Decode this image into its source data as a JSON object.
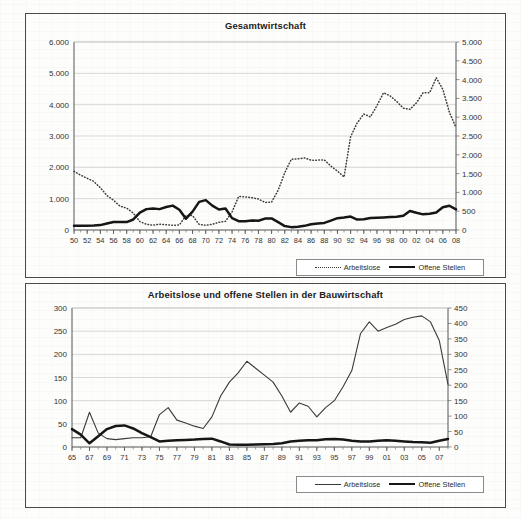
{
  "page": {
    "background_color": "#fdfdfc",
    "frame_color": "#4a4a4a"
  },
  "charts": [
    {
      "id": "top",
      "title": "Gesamtwirtschaft",
      "legend": [
        {
          "label": "Arbeitslose",
          "style": "dotted"
        },
        {
          "label": "Offene Stellen",
          "style": "thick"
        }
      ]
    },
    {
      "id": "bottom",
      "title": "Arbeitslose und offene Stellen in der Bauwirtschaft",
      "legend": [
        {
          "label": "Arbeitslose",
          "style": "thin"
        },
        {
          "label": "Offene Stellen",
          "style": "thick"
        }
      ]
    }
  ],
  "chart_data": [
    {
      "type": "line",
      "id": "gesamtwirtschaft",
      "title": "Gesamtwirtschaft",
      "xlabel": "",
      "ylabel": "",
      "grid": true,
      "legend_position": "bottom-right",
      "x": [
        1950,
        1951,
        1952,
        1953,
        1954,
        1955,
        1956,
        1957,
        1958,
        1959,
        1960,
        1961,
        1962,
        1963,
        1964,
        1965,
        1966,
        1967,
        1968,
        1969,
        1970,
        1971,
        1972,
        1973,
        1974,
        1975,
        1976,
        1977,
        1978,
        1979,
        1980,
        1981,
        1982,
        1983,
        1984,
        1985,
        1986,
        1987,
        1988,
        1989,
        1990,
        1991,
        1992,
        1993,
        1994,
        1995,
        1996,
        1997,
        1998,
        1999,
        2000,
        2001,
        2002,
        2003,
        2004,
        2005,
        2006,
        2007,
        2008
      ],
      "xtick_labels": [
        "50",
        "52",
        "54",
        "56",
        "58",
        "60",
        "62",
        "64",
        "66",
        "68",
        "70",
        "72",
        "74",
        "76",
        "78",
        "80",
        "82",
        "84",
        "86",
        "88",
        "90",
        "92",
        "94",
        "96",
        "98",
        "00",
        "02",
        "04",
        "06",
        "08"
      ],
      "xtick_step_years": 2,
      "axis_left": {
        "label": "Arbeitslose",
        "min": 0,
        "max": 6000,
        "step": 1000,
        "ticks": [
          "0",
          "1.000",
          "2.000",
          "3.000",
          "4.000",
          "5.000",
          "6.000"
        ]
      },
      "axis_right": {
        "label": "Offene Stellen",
        "min": 0,
        "max": 5000,
        "step": 500,
        "ticks": [
          "0",
          "500",
          "1.000",
          "1.500",
          "2.000",
          "2.500",
          "3.000",
          "3.500",
          "4.000",
          "4.500",
          "5.000"
        ]
      },
      "series": [
        {
          "name": "Arbeitslose",
          "style": "dotted",
          "axis": "left",
          "unit": "Tsd.",
          "values": [
            1870,
            1750,
            1650,
            1550,
            1350,
            1100,
            950,
            760,
            700,
            540,
            270,
            180,
            155,
            185,
            170,
            150,
            160,
            460,
            460,
            180,
            150,
            185,
            245,
            275,
            580,
            1070,
            1060,
            1030,
            990,
            880,
            890,
            1270,
            1830,
            2260,
            2270,
            2300,
            2230,
            2230,
            2240,
            2040,
            1880,
            1690,
            2980,
            3420,
            3700,
            3610,
            3970,
            4380,
            4280,
            4100,
            3890,
            3850,
            4060,
            4380,
            4380,
            4860,
            4490,
            3760,
            3270
          ]
        },
        {
          "name": "Offene Stellen",
          "style": "thick",
          "axis": "right",
          "unit": "Tsd.",
          "values": [
            110,
            110,
            115,
            120,
            130,
            175,
            215,
            215,
            210,
            280,
            465,
            555,
            574,
            555,
            610,
            649,
            540,
            302,
            488,
            747,
            795,
            648,
            546,
            572,
            315,
            236,
            235,
            255,
            246,
            304,
            308,
            208,
            105,
            76,
            88,
            110,
            154,
            171,
            189,
            251,
            314,
            331,
            356,
            276,
            286,
            318,
            327,
            335,
            346,
            350,
            377,
            505,
            458,
            416,
            432,
            466,
            604,
            645,
            548
          ]
        }
      ]
    },
    {
      "type": "line",
      "id": "bauwirtschaft",
      "title": "Arbeitslose und offene Stellen in der Bauwirtschaft",
      "xlabel": "",
      "ylabel": "",
      "grid": true,
      "legend_position": "bottom-right",
      "x": [
        1965,
        1966,
        1967,
        1968,
        1969,
        1970,
        1971,
        1972,
        1973,
        1974,
        1975,
        1976,
        1977,
        1978,
        1979,
        1980,
        1981,
        1982,
        1983,
        1984,
        1985,
        1986,
        1987,
        1988,
        1989,
        1990,
        1991,
        1992,
        1993,
        1994,
        1995,
        1996,
        1997,
        1998,
        1999,
        2000,
        2001,
        2002,
        2003,
        2004,
        2005,
        2006,
        2007,
        2008
      ],
      "xtick_labels": [
        "65",
        "67",
        "69",
        "71",
        "73",
        "75",
        "77",
        "79",
        "81",
        "83",
        "85",
        "87",
        "89",
        "91",
        "93",
        "95",
        "97",
        "99",
        "01",
        "03",
        "05",
        "07"
      ],
      "xtick_step_years": 2,
      "axis_left": {
        "label": "Arbeitslose",
        "min": 0,
        "max": 300,
        "step": 50,
        "ticks": [
          "0",
          "50",
          "100",
          "150",
          "200",
          "250",
          "300"
        ]
      },
      "axis_right": {
        "label": "Offene Stellen",
        "min": 0,
        "max": 450,
        "step": 50,
        "ticks": [
          "0",
          "50",
          "100",
          "150",
          "200",
          "250",
          "300",
          "350",
          "400",
          "450"
        ]
      },
      "series": [
        {
          "name": "Arbeitslose",
          "style": "thin",
          "axis": "left",
          "unit": "Tsd.",
          "values": [
            20,
            20,
            75,
            30,
            18,
            16,
            18,
            20,
            20,
            22,
            70,
            85,
            58,
            52,
            45,
            40,
            65,
            110,
            140,
            160,
            185,
            170,
            155,
            140,
            110,
            75,
            95,
            88,
            65,
            85,
            100,
            130,
            165,
            245,
            270,
            250,
            258,
            265,
            275,
            280,
            283,
            270,
            230,
            135
          ]
        },
        {
          "name": "Offene Stellen",
          "style": "thick",
          "axis": "right",
          "unit": "Tsd.",
          "values": [
            58,
            40,
            12,
            35,
            58,
            68,
            70,
            60,
            45,
            32,
            18,
            20,
            22,
            23,
            24,
            26,
            27,
            18,
            8,
            7,
            7,
            8,
            9,
            10,
            12,
            18,
            20,
            22,
            22,
            25,
            26,
            24,
            20,
            18,
            18,
            20,
            22,
            20,
            18,
            16,
            15,
            14,
            20,
            26
          ]
        }
      ]
    }
  ]
}
